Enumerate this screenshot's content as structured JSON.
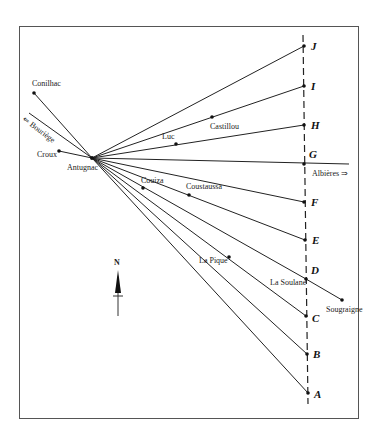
{
  "diagram": {
    "frame": {
      "x": 19,
      "y": 26,
      "w": 339,
      "h": 392
    },
    "origin": {
      "name": "Antugnac",
      "x": 92,
      "y": 158,
      "lx": 67,
      "ly": 170
    },
    "meridian": {
      "x1": 303,
      "y1": 35,
      "x2": 308,
      "y2": 404
    },
    "targets": [
      {
        "id": "J",
        "x": 304,
        "y": 46,
        "lx": 311,
        "ly": 50
      },
      {
        "id": "I",
        "x": 304,
        "y": 86,
        "lx": 311,
        "ly": 90
      },
      {
        "id": "H",
        "x": 304,
        "y": 125,
        "lx": 311,
        "ly": 129
      },
      {
        "id": "G",
        "x": 304,
        "y": 164,
        "lx": 309,
        "ly": 158
      },
      {
        "id": "F",
        "x": 304,
        "y": 202,
        "lx": 311,
        "ly": 206
      },
      {
        "id": "E",
        "x": 305,
        "y": 240,
        "lx": 312,
        "ly": 244
      },
      {
        "id": "D",
        "x": 306,
        "y": 279,
        "lx": 311,
        "ly": 274
      },
      {
        "id": "C",
        "x": 306,
        "y": 316,
        "lx": 312,
        "ly": 322
      },
      {
        "id": "B",
        "x": 307,
        "y": 354,
        "lx": 313,
        "ly": 358
      },
      {
        "id": "A",
        "x": 308,
        "y": 393,
        "lx": 314,
        "ly": 398
      }
    ],
    "places": [
      {
        "name": "Conilhac",
        "x": 34,
        "y": 93,
        "lx": 32,
        "ly": 86
      },
      {
        "name": "Croux",
        "x": 59,
        "y": 151,
        "lx": 37,
        "ly": 157
      },
      {
        "name": "Luc",
        "x": 176,
        "y": 144,
        "lx": 162,
        "ly": 139
      },
      {
        "name": "Castillou",
        "x": 212,
        "y": 117,
        "lx": 210,
        "ly": 129
      },
      {
        "name": "Couiza",
        "x": 143,
        "y": 188,
        "lx": 141,
        "ly": 183
      },
      {
        "name": "Coustaussa",
        "x": 189,
        "y": 195,
        "lx": 186,
        "ly": 189
      },
      {
        "name": "La Pique",
        "x": 229,
        "y": 257,
        "lx": 199,
        "ly": 263
      },
      {
        "name": "La Soulane",
        "x": 306,
        "y": 279,
        "lx": 270,
        "ly": 285
      },
      {
        "name": "Sougraigne",
        "x": 342,
        "y": 300,
        "lx": 326,
        "ly": 312
      }
    ],
    "bouriege": {
      "label": "⇐ Bouriège",
      "x1": 29,
      "y1": 113,
      "lx": 22,
      "ly": 120
    },
    "albieres": {
      "label": "Albières ⇒",
      "x2": 349,
      "y2": 164,
      "lx": 312,
      "ly": 176
    },
    "north": {
      "label": "N",
      "x": 118,
      "y": 264
    }
  }
}
